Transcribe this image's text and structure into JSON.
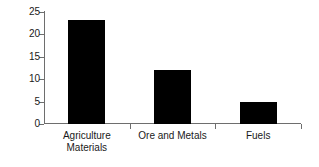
{
  "chart_data": {
    "type": "bar",
    "title": "",
    "subtitle": "",
    "xlabel": "",
    "ylabel": "",
    "categories": [
      "Agriculture\nMaterials",
      "Ore and Metals",
      "Fuels"
    ],
    "category_labels_flat": [
      "Agriculture Materials",
      "Ore and Metals",
      "Fuels"
    ],
    "values": [
      23.3,
      12.0,
      4.9
    ],
    "ylim": [
      0,
      25
    ],
    "yticks": [
      0,
      5,
      10,
      15,
      20,
      25
    ],
    "ytick_labels": [
      "0",
      "5",
      "10",
      "15",
      "20",
      "25"
    ],
    "grid": false,
    "legend": false,
    "legend_position": "none",
    "bar_color": "#000000",
    "axis_color": "#6e6e6e",
    "background_color": "#ffffff",
    "annotations": []
  }
}
